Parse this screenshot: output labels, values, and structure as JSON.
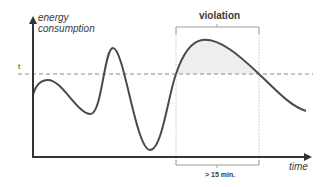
{
  "diagram": {
    "y_axis_label_line1": "energy",
    "y_axis_label_line2": "consumption",
    "x_axis_label": "time",
    "threshold_label": "t",
    "violation_label": "violation",
    "duration_label": "> 15 min.",
    "colors": {
      "curve": "#4a4a4a",
      "axis": "#333333",
      "threshold": "#8a8a8a",
      "violation_fill": "#eeeeee",
      "bracket": "#a0a0a0"
    }
  }
}
